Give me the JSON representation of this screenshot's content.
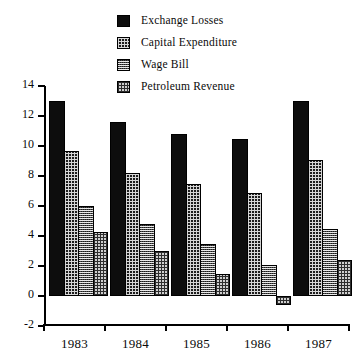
{
  "chart_data": {
    "type": "bar",
    "title": "",
    "subtitle": "",
    "xlabel": "",
    "ylabel": "",
    "categories": [
      "1983",
      "1984",
      "1985",
      "1986",
      "1987"
    ],
    "series": [
      {
        "name": "Exchange Losses",
        "pattern": "solid",
        "values": [
          13.0,
          11.6,
          10.8,
          10.5,
          13.0
        ]
      },
      {
        "name": "Capital Expenditure",
        "pattern": "dense",
        "values": [
          9.7,
          8.2,
          7.5,
          6.9,
          9.1
        ]
      },
      {
        "name": "Wage Bill",
        "pattern": "mid",
        "values": [
          6.0,
          4.8,
          3.5,
          2.1,
          4.5
        ]
      },
      {
        "name": "Petroleum Revenue",
        "pattern": "light",
        "values": [
          4.3,
          3.0,
          1.5,
          -0.6,
          2.4
        ]
      }
    ],
    "ylim": [
      -2,
      14
    ],
    "ytick_labels": [
      "14",
      "12",
      "10",
      "8",
      "6",
      "4",
      "2",
      "0",
      "-2"
    ],
    "ytick_values": [
      14,
      12,
      10,
      8,
      6,
      4,
      2,
      0,
      -2
    ],
    "grid": false,
    "legend_position": "top-center",
    "colors": {
      "exchange_losses": "#0d0d0d",
      "capital_expenditure": "#1d1d1d",
      "wage_bill": "#4a4a4a",
      "petroleum_revenue": "#cfcfcf",
      "axis": "#000000",
      "background": "#ffffff"
    }
  },
  "legend": {
    "items": [
      {
        "label": "Exchange Losses"
      },
      {
        "label": "Capital Expenditure"
      },
      {
        "label": "Wage Bill"
      },
      {
        "label": "Petroleum Revenue"
      }
    ]
  }
}
